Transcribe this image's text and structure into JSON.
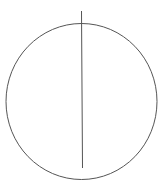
{
  "diagram": {
    "background": "#ffffff",
    "stroke_color": "#555555",
    "circle": {
      "cx": 81.5,
      "cy": 101.5,
      "rx": 75.5,
      "ry": 78
    },
    "vertical_line": {
      "x1": 81.5,
      "y1": 11,
      "x2": 82.5,
      "y2": 168
    }
  }
}
